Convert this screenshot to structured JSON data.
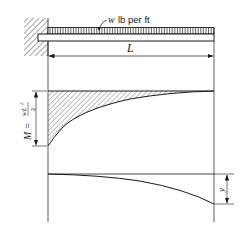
{
  "diagram": {
    "load_label_var": "w",
    "load_label_unit": "lb per ft",
    "span_label": "L",
    "moment_label": "M = wL²/2",
    "moment_label_lhs": "M =",
    "moment_label_num": "wL",
    "moment_label_exp": "2",
    "moment_label_den": "2",
    "deflection_label": "y",
    "colors": {
      "line": "#1a1a1a",
      "hatch": "#333333",
      "background": "#ffffff"
    }
  }
}
